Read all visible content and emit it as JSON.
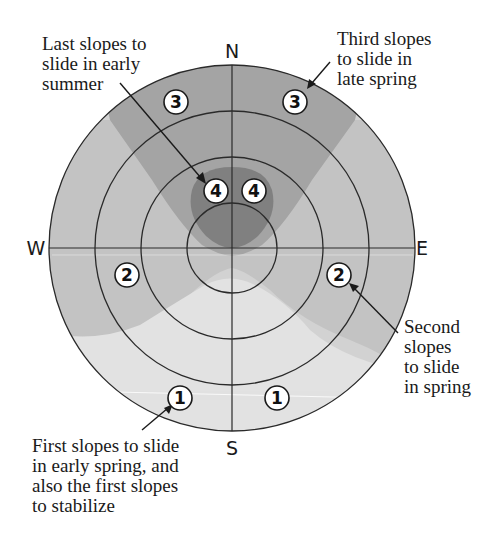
{
  "diagram": {
    "compass": {
      "n": "N",
      "e": "E",
      "s": "S",
      "w": "W"
    },
    "colors": {
      "zone1": "#e3e3e3",
      "zone2": "#c4c4c4",
      "zone2_outer": "#d0d0d0",
      "zone3": "#a4a4a4",
      "zone4": "#7f7f7f",
      "lines": "#2a2a2a",
      "badge_fill": "#ffffff"
    },
    "badges": [
      {
        "id": "badge-3-nw",
        "value": "3"
      },
      {
        "id": "badge-3-ne",
        "value": "3"
      },
      {
        "id": "badge-4-left",
        "value": "4"
      },
      {
        "id": "badge-4-right",
        "value": "4"
      },
      {
        "id": "badge-2-w",
        "value": "2"
      },
      {
        "id": "badge-2-e",
        "value": "2"
      },
      {
        "id": "badge-1-sw",
        "value": "1"
      },
      {
        "id": "badge-1-se",
        "value": "1"
      }
    ],
    "annotations": {
      "last": {
        "lines": [
          "Last slopes to",
          "slide in early",
          "summer"
        ]
      },
      "third": {
        "lines": [
          "Third slopes",
          "to slide in",
          "late spring"
        ]
      },
      "second": {
        "lines": [
          "Second",
          "slopes",
          "to slide",
          "in spring"
        ]
      },
      "first": {
        "lines": [
          "First slopes to slide",
          "in early spring, and",
          "also the first slopes",
          "to stabilize"
        ]
      }
    }
  }
}
